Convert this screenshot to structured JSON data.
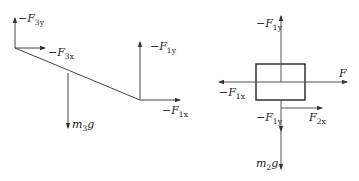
{
  "diagram": {
    "left": {
      "name": "beam-free-body",
      "labels": {
        "f3y": {
          "prefix": "−F",
          "sub": "3y"
        },
        "f3x": {
          "prefix": "−F",
          "sub": "3x"
        },
        "m3g": {
          "prefix": "m",
          "sub": "3",
          "suffix": "g"
        },
        "f1y": {
          "prefix": "−F",
          "sub": "1y"
        },
        "f1x": {
          "prefix": "−F",
          "sub": "1x"
        }
      }
    },
    "right": {
      "name": "block-free-body",
      "labels": {
        "f1y_top": {
          "prefix": "−F",
          "sub": "1y"
        },
        "f": {
          "prefix": "F"
        },
        "f1x": {
          "prefix": "−F",
          "sub": "1x"
        },
        "f1y_bottom": {
          "prefix": "−F",
          "sub": "1y"
        },
        "f2x": {
          "prefix": "F",
          "sub": "2x"
        },
        "m2g": {
          "prefix": "m",
          "sub": "2",
          "suffix": "g"
        }
      }
    },
    "colors": {
      "stroke": "#333333",
      "box": "#222222"
    }
  }
}
